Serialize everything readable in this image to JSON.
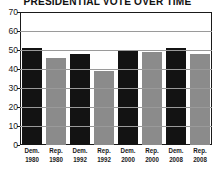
{
  "chart_data": {
    "type": "bar",
    "title": "PRESIDENTIAL VOTE OVER TIME",
    "xlabel": "",
    "ylabel": "",
    "ylim": [
      0,
      70
    ],
    "ytick_step": 10,
    "yticks": [
      0,
      10,
      20,
      30,
      40,
      50,
      60,
      70
    ],
    "grid": true,
    "legend": "none",
    "categories": [
      "Dem. 1980",
      "Rep. 1980",
      "Dem. 1992",
      "Rep. 1992",
      "Dem. 2000",
      "Rep. 2000",
      "Dem. 2008",
      "Rep. 2008"
    ],
    "party_labels": [
      "Dem.",
      "Rep.",
      "Dem.",
      "Rep.",
      "Dem.",
      "Rep.",
      "Dem.",
      "Rep."
    ],
    "year_labels": [
      "1980",
      "1980",
      "1992",
      "1992",
      "2000",
      "2000",
      "2008",
      "2008"
    ],
    "values": [
      51,
      46,
      48,
      39,
      50,
      49,
      51,
      48
    ],
    "bar_colors": [
      "#131313",
      "#8b8b8b",
      "#131313",
      "#8b8b8b",
      "#131313",
      "#8b8b8b",
      "#131313",
      "#8b8b8b"
    ],
    "series": [
      {
        "name": "Democratic",
        "color": "#131313",
        "points": [
          {
            "x": "1980",
            "y": 51
          },
          {
            "x": "1992",
            "y": 48
          },
          {
            "x": "2000",
            "y": 50
          },
          {
            "x": "2008",
            "y": 51
          }
        ]
      },
      {
        "name": "Republican",
        "color": "#8b8b8b",
        "points": [
          {
            "x": "1980",
            "y": 46
          },
          {
            "x": "1992",
            "y": 39
          },
          {
            "x": "2000",
            "y": 49
          },
          {
            "x": "2008",
            "y": 48
          }
        ]
      }
    ]
  },
  "colors": {
    "democrat_bar": "#131313",
    "republican_bar": "#8b8b8b",
    "axis": "#1a1a1a",
    "gridline": "#9a9a9a",
    "background": "#ffffff",
    "text": "#1a1a1a"
  }
}
